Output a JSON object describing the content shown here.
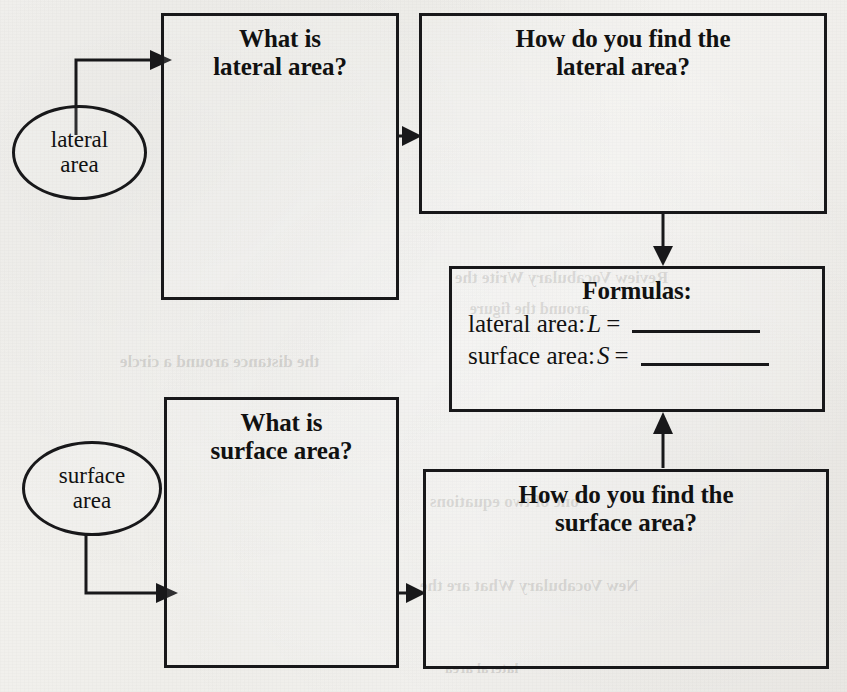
{
  "diagram": {
    "ink_color": "#18181a",
    "paper_color": "#f2f1ee"
  },
  "ovals": [
    {
      "id": "lateral-area-oval",
      "line1": "lateral",
      "line2": "area"
    },
    {
      "id": "surface-area-oval",
      "line1": "surface",
      "line2": "area"
    }
  ],
  "boxes": [
    {
      "id": "what-is-lateral-area",
      "line1": "What is",
      "line2": "lateral area?"
    },
    {
      "id": "how-find-lateral-area",
      "line1": "How do you find the",
      "line2": "lateral area?"
    },
    {
      "id": "what-is-surface-area",
      "line1": "What is",
      "line2": "surface area?"
    },
    {
      "id": "how-find-surface-area",
      "line1": "How do you find the",
      "line2": "surface area?"
    }
  ],
  "formulas": {
    "title": "Formulas:",
    "rows": [
      {
        "label": "lateral area:",
        "variable": "L",
        "equals": "=",
        "answer": ""
      },
      {
        "label": "surface area:",
        "variable": "S",
        "equals": "=",
        "answer": ""
      }
    ]
  },
  "background_bleed": [
    {
      "text": "Review Vocabulary Write the",
      "x": 455,
      "y": 268,
      "size": 17
    },
    {
      "text": "around the figure",
      "x": 470,
      "y": 300,
      "size": 16
    },
    {
      "text": "the distance around a circle",
      "x": 120,
      "y": 352,
      "size": 17
    },
    {
      "text": "one of two equations",
      "x": 430,
      "y": 492,
      "size": 17
    },
    {
      "text": "New Vocabulary  What are the",
      "x": 420,
      "y": 576,
      "size": 17
    },
    {
      "text": "lateral area",
      "x": 445,
      "y": 660,
      "size": 15
    }
  ]
}
